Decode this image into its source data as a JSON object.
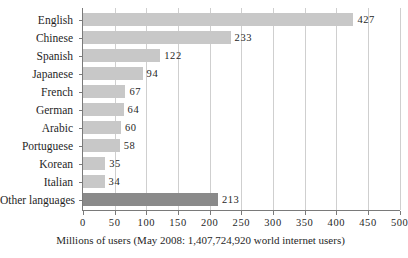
{
  "chart_data": {
    "type": "bar",
    "orientation": "horizontal",
    "title": "",
    "subtitle": "",
    "xlabel": "Millions of users (May 2008: 1,407,724,920 world internet users)",
    "ylabel": "",
    "categories": [
      "English",
      "Chinese",
      "Spanish",
      "Japanese",
      "French",
      "German",
      "Arabic",
      "Portuguese",
      "Korean",
      "Italian",
      "Other languages"
    ],
    "values": [
      427,
      233,
      122,
      94,
      67,
      64,
      60,
      58,
      35,
      34,
      213
    ],
    "value_labels": [
      "427",
      "233",
      "122",
      "94",
      "67",
      "64",
      "60",
      "58",
      "35",
      "34",
      "213"
    ],
    "xlim": [
      0,
      500
    ],
    "xticks": [
      0,
      50,
      100,
      150,
      200,
      250,
      300,
      350,
      400,
      450,
      500
    ],
    "xtick_labels": [
      "0",
      "50",
      "100",
      "150",
      "200",
      "250",
      "300",
      "350",
      "400",
      "450",
      "500"
    ],
    "grid": true,
    "legend": null,
    "bar_color": "#c8c8c8",
    "highlight_color": "#8a8a8a",
    "highlight_categories": [
      "Other languages"
    ],
    "axis_color": "#7a7a7a",
    "gridline_color": "#cfcfcf",
    "background_color": "#ffffff"
  }
}
